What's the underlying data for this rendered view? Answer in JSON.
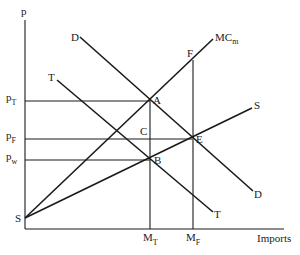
{
  "diagram": {
    "axes": {
      "y_label": "p",
      "x_label": "Imports"
    },
    "price_levels": [
      {
        "id": "pT",
        "base": "p",
        "sub": "T",
        "y": 101
      },
      {
        "id": "pF",
        "base": "p",
        "sub": "F",
        "y": 139
      },
      {
        "id": "pw",
        "base": "p",
        "sub": "w",
        "y": 160
      }
    ],
    "quantity_levels": [
      {
        "id": "MT",
        "base": "M",
        "sub": "T",
        "x": 150
      },
      {
        "id": "MF",
        "base": "M",
        "sub": "F",
        "x": 193
      }
    ],
    "curves": [
      {
        "name": "D",
        "label": "D",
        "label_end": "D",
        "from": [
          80,
          37
        ],
        "to": [
          253,
          191
        ]
      },
      {
        "name": "T",
        "label": "T",
        "label_end": "T",
        "from": [
          57,
          80
        ],
        "to": [
          213,
          212
        ]
      },
      {
        "name": "MCm",
        "label_base": "MC",
        "label_sub": "m",
        "from": [
          25,
          218
        ],
        "to": [
          213,
          39
        ]
      },
      {
        "name": "S",
        "label": "S",
        "label_origin": "S",
        "from": [
          25,
          218
        ],
        "to": [
          252,
          108
        ]
      }
    ],
    "points": [
      {
        "name": "A",
        "label": "A",
        "x": 150,
        "y": 100
      },
      {
        "name": "B",
        "label": "B",
        "x": 150,
        "y": 160
      },
      {
        "name": "C",
        "label": "C",
        "x": 150,
        "y": 139
      },
      {
        "name": "E",
        "label": "E",
        "x": 192,
        "y": 139
      },
      {
        "name": "F",
        "label": "F",
        "x": 193,
        "y": 60
      }
    ]
  }
}
